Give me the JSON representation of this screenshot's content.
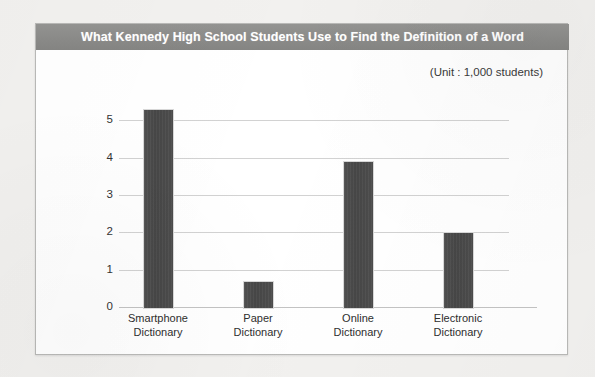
{
  "chart_data": {
    "type": "bar",
    "title": "What Kennedy High School Students Use to Find the Definition of a Word",
    "subtitle": "(Unit : 1,000 students)",
    "xlabel": "",
    "ylabel": "",
    "ylim": [
      0,
      5.6
    ],
    "yticks": [
      "0",
      "1",
      "2",
      "3",
      "4",
      "5"
    ],
    "grid": true,
    "legend": "none",
    "categories": [
      "Smartphone Dictionary",
      "Paper Dictionary",
      "Online Dictionary",
      "Electronic Dictionary"
    ],
    "category_lines": [
      [
        "Smartphone",
        "Dictionary"
      ],
      [
        "Paper",
        "Dictionary"
      ],
      [
        "Online",
        "Dictionary"
      ],
      [
        "Electronic",
        "Dictionary"
      ]
    ],
    "values": [
      5.3,
      0.7,
      3.9,
      2.0
    ],
    "bar_color": "#4a4a4a",
    "title_bar_color": "#8b8b89",
    "title_text_color": "#ffffff",
    "gridline_color": "#d2d2d2",
    "card_background": "#ffffff",
    "page_background": "#f2f1ef"
  }
}
